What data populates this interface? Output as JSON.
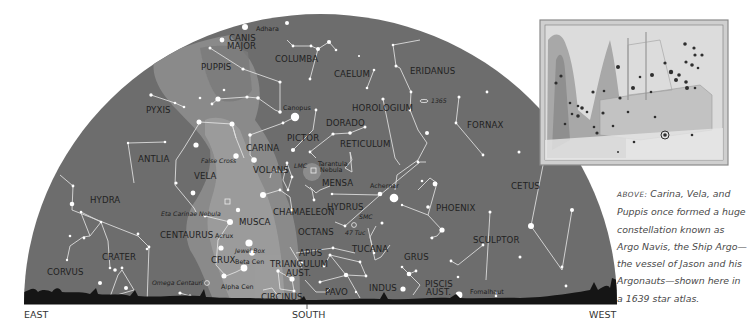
{
  "directions": {
    "east": "EAST",
    "south": "SOUTH",
    "west": "WEST"
  },
  "constellations": [
    {
      "id": "canis-major",
      "label": "CANIS",
      "label2": "MAJOR"
    },
    {
      "id": "puppis",
      "label": "PUPPIS"
    },
    {
      "id": "columba",
      "label": "COLUMBA"
    },
    {
      "id": "caelum",
      "label": "CAELUM"
    },
    {
      "id": "eridanus",
      "label": "ERIDANUS"
    },
    {
      "id": "pyxis",
      "label": "PYXIS"
    },
    {
      "id": "horologium",
      "label": "HOROLOGIUM"
    },
    {
      "id": "fornax",
      "label": "FORNAX"
    },
    {
      "id": "pictor",
      "label": "PICTOR"
    },
    {
      "id": "dorado",
      "label": "DORADO"
    },
    {
      "id": "reticulum",
      "label": "RETICULUM"
    },
    {
      "id": "carina",
      "label": "CARINA"
    },
    {
      "id": "antlia",
      "label": "ANTLIA"
    },
    {
      "id": "vela",
      "label": "VELA"
    },
    {
      "id": "volans",
      "label": "VOLANS"
    },
    {
      "id": "mensa",
      "label": "MENSA"
    },
    {
      "id": "cetus",
      "label": "CETUS"
    },
    {
      "id": "hydra",
      "label": "HYDRA"
    },
    {
      "id": "chamaeleon",
      "label": "CHAMAELEON"
    },
    {
      "id": "hydrus",
      "label": "HYDRUS"
    },
    {
      "id": "phoenix",
      "label": "PHOENIX"
    },
    {
      "id": "musca",
      "label": "MUSCA"
    },
    {
      "id": "centaurus",
      "label": "CENTAURUS"
    },
    {
      "id": "octans",
      "label": "OCTANS"
    },
    {
      "id": "sculptor",
      "label": "SCULPTOR"
    },
    {
      "id": "crater",
      "label": "CRATER"
    },
    {
      "id": "crux",
      "label": "CRUX"
    },
    {
      "id": "apus",
      "label": "APUS"
    },
    {
      "id": "tucana",
      "label": "TUCANA"
    },
    {
      "id": "grus",
      "label": "GRUS"
    },
    {
      "id": "corvus",
      "label": "CORVUS"
    },
    {
      "id": "triangulum-aust",
      "label": "TRIANGULUM",
      "label2": "AUST."
    },
    {
      "id": "indus",
      "label": "INDUS"
    },
    {
      "id": "piscis-aust",
      "label": "PISCIS",
      "label2": "AUST."
    },
    {
      "id": "pavo",
      "label": "PAVO"
    },
    {
      "id": "circinus",
      "label": "CIRCINUS"
    }
  ],
  "stars": {
    "adhara": "Adhara",
    "canopus": "Canopus",
    "achernar": "Achernar",
    "acrux": "Acrux",
    "beta_cen": "Beta Cen",
    "alpha_cen": "Alpha Cen",
    "fomalhaut": "Fomalhaut"
  },
  "deep_sky": {
    "ngc1365": "1365",
    "false_cross": "False Cross",
    "lmc": "LMC",
    "tarantula": "Tarantula",
    "tarantula2": "Nebula",
    "smc": "SMC",
    "tuc47": "47 Tuc",
    "eta_carinae": "Eta Carinae Nebula",
    "jewel_box": "Jewel Box",
    "omega_centauri": "Omega Centauri"
  },
  "inset": {
    "description": "1639 star atlas illustration of Argo Navis"
  },
  "caption": {
    "lead": "Above:",
    "text": " Carina, Vela, and Puppis once formed a huge constellation known as Argo Navis, the Ship Argo—the vessel of Jason and his Argonauts—shown here in a 1639 star atlas."
  },
  "colors": {
    "sky": "#6d6d6d",
    "milky_way": "#8c8c8c",
    "milky_way_core": "#a8a8a8",
    "horizon": "#111111",
    "text": "#222222"
  }
}
